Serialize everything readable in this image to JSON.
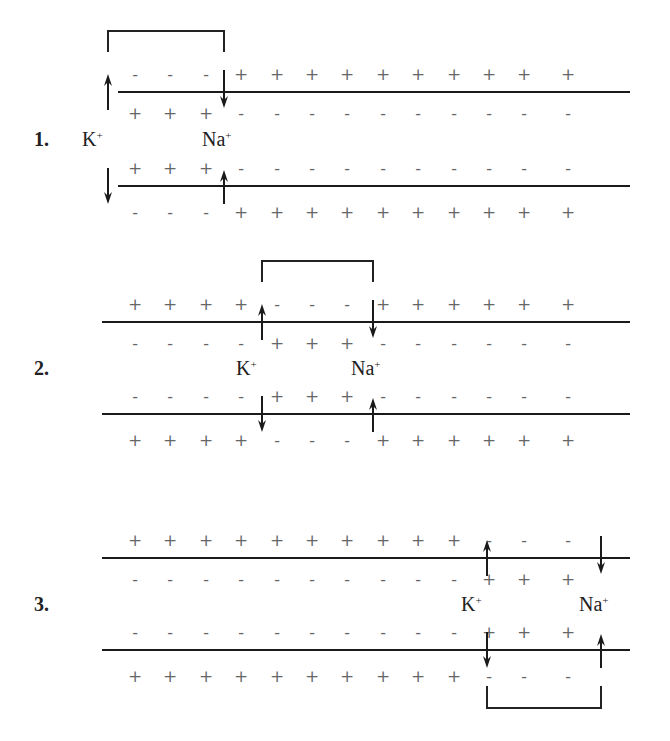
{
  "ion_labels": {
    "k": "K",
    "na": "Na",
    "charge": "+"
  },
  "steps": [
    {
      "label": "1.",
      "membrane_x": [
        118,
        630
      ],
      "top_y": 92,
      "bottom_y": 186,
      "k_x": 108,
      "na_x": 224,
      "bracket": "top",
      "outer_top": [
        "-",
        "-",
        "-",
        "+",
        "+",
        "+",
        "+",
        "+",
        "+",
        "+",
        "+",
        "+",
        "+"
      ],
      "inner_top": [
        "+",
        "+",
        "+",
        "-",
        "-",
        "-",
        "-",
        "-",
        "-",
        "-",
        "-",
        "-",
        "-"
      ],
      "inner_bottom": [
        "+",
        "+",
        "+",
        "-",
        "-",
        "-",
        "-",
        "-",
        "-",
        "-",
        "-",
        "-",
        "-"
      ],
      "outer_bottom": [
        "-",
        "-",
        "-",
        "+",
        "+",
        "+",
        "+",
        "+",
        "+",
        "+",
        "+",
        "+",
        "+"
      ]
    },
    {
      "label": "2.",
      "membrane_x": [
        102,
        630
      ],
      "top_y": 322,
      "bottom_y": 414,
      "k_x": 262,
      "na_x": 373,
      "bracket": "top",
      "outer_top": [
        "+",
        "+",
        "+",
        "+",
        "-",
        "-",
        "-",
        "+",
        "+",
        "+",
        "+",
        "+",
        "+"
      ],
      "inner_top": [
        "-",
        "-",
        "-",
        "-",
        "+",
        "+",
        "+",
        "-",
        "-",
        "-",
        "-",
        "-",
        "-"
      ],
      "inner_bottom": [
        "-",
        "-",
        "-",
        "-",
        "+",
        "+",
        "+",
        "-",
        "-",
        "-",
        "-",
        "-",
        "-"
      ],
      "outer_bottom": [
        "+",
        "+",
        "+",
        "+",
        "-",
        "-",
        "-",
        "+",
        "+",
        "+",
        "+",
        "+",
        "+"
      ]
    },
    {
      "label": "3.",
      "membrane_x": [
        102,
        630
      ],
      "top_y": 558,
      "bottom_y": 650,
      "k_x": 487,
      "na_x": 601,
      "bracket": "bottom",
      "outer_top": [
        "+",
        "+",
        "+",
        "+",
        "+",
        "+",
        "+",
        "+",
        "+",
        "+",
        "-",
        "-",
        "-"
      ],
      "inner_top": [
        "-",
        "-",
        "-",
        "-",
        "-",
        "-",
        "-",
        "-",
        "-",
        "-",
        "+",
        "+",
        "+"
      ],
      "inner_bottom": [
        "-",
        "-",
        "-",
        "-",
        "-",
        "-",
        "-",
        "-",
        "-",
        "-",
        "+",
        "+",
        "+"
      ],
      "outer_bottom": [
        "+",
        "+",
        "+",
        "+",
        "+",
        "+",
        "+",
        "+",
        "+",
        "+",
        "-",
        "-",
        "-"
      ]
    }
  ],
  "charge_x_positions": [
    135,
    170,
    206,
    241,
    277,
    312,
    347,
    383,
    418,
    454,
    489,
    524,
    568
  ]
}
